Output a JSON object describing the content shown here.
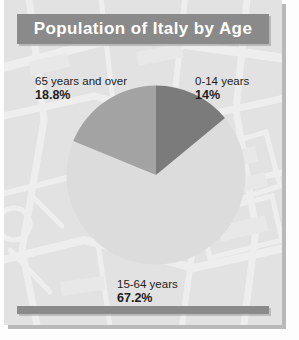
{
  "card": {
    "title": "Population of Italy by Age",
    "background_color": "#e2e2e2",
    "banner_color": "#8a8a8a",
    "title_color": "#ffffff",
    "bottom_bar_color": "#8a8a8a"
  },
  "labels": {
    "older": {
      "name": "65 years and over",
      "percent": "18.8%"
    },
    "young": {
      "name": "0-14 years",
      "percent": "14%"
    },
    "middle": {
      "name": "15-64 years",
      "percent": "67.2%"
    }
  },
  "chart_data": {
    "type": "pie",
    "title": "Population of Italy by Age",
    "xlabel": "",
    "ylabel": "",
    "grid": false,
    "legend": "none",
    "units": "percent",
    "start_angle_deg": 0,
    "direction": "clockwise",
    "categories": [
      "0-14 years",
      "15-64 years",
      "65 years and over"
    ],
    "values": [
      14,
      67.2,
      18.8
    ],
    "colors": [
      "#7b7b7b",
      "#dcdcdc",
      "#a3a3a3"
    ],
    "labels": [
      "14%",
      "67.2%",
      "18.8%"
    ],
    "slices": [
      {
        "name": "0-14 years",
        "value": 14,
        "label": "14%",
        "color": "#7b7b7b"
      },
      {
        "name": "15-64 years",
        "value": 67.2,
        "label": "67.2%",
        "color": "#dcdcdc"
      },
      {
        "name": "65 years and over",
        "value": 18.8,
        "label": "18.8%",
        "color": "#a3a3a3"
      }
    ]
  }
}
